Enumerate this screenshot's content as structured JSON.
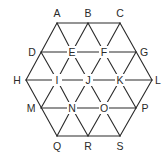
{
  "diagram": {
    "type": "hexagonal-triangular-grid",
    "colors": {
      "line": "#2a2a2a",
      "text": "#2a2a2a",
      "background": "#ffffff"
    },
    "nodes": [
      {
        "id": "A",
        "x": 57,
        "y": 23,
        "lx": 57,
        "ly": 13,
        "bg": false
      },
      {
        "id": "B",
        "x": 88,
        "y": 23,
        "lx": 88,
        "ly": 13,
        "bg": false
      },
      {
        "id": "C",
        "x": 120,
        "y": 23,
        "lx": 120,
        "ly": 13,
        "bg": false
      },
      {
        "id": "D",
        "x": 41,
        "y": 52,
        "lx": 32,
        "ly": 52,
        "bg": false
      },
      {
        "id": "E",
        "x": 72,
        "y": 52,
        "lx": 72,
        "ly": 52,
        "bg": true
      },
      {
        "id": "F",
        "x": 104,
        "y": 52,
        "lx": 104,
        "ly": 52,
        "bg": true
      },
      {
        "id": "G",
        "x": 136,
        "y": 52,
        "lx": 144,
        "ly": 52,
        "bg": false
      },
      {
        "id": "H",
        "x": 26,
        "y": 80,
        "lx": 17,
        "ly": 80,
        "bg": false
      },
      {
        "id": "I",
        "x": 57,
        "y": 80,
        "lx": 57,
        "ly": 80,
        "bg": true
      },
      {
        "id": "J",
        "x": 88,
        "y": 80,
        "lx": 88,
        "ly": 80,
        "bg": true
      },
      {
        "id": "K",
        "x": 120,
        "y": 80,
        "lx": 120,
        "ly": 80,
        "bg": true
      },
      {
        "id": "L",
        "x": 152,
        "y": 80,
        "lx": 158,
        "ly": 80,
        "bg": false
      },
      {
        "id": "M",
        "x": 41,
        "y": 108,
        "lx": 31,
        "ly": 108,
        "bg": false
      },
      {
        "id": "N",
        "x": 72,
        "y": 108,
        "lx": 72,
        "ly": 108,
        "bg": true
      },
      {
        "id": "O",
        "x": 104,
        "y": 108,
        "lx": 104,
        "ly": 108,
        "bg": true
      },
      {
        "id": "P",
        "x": 136,
        "y": 108,
        "lx": 145,
        "ly": 108,
        "bg": false
      },
      {
        "id": "Q",
        "x": 57,
        "y": 136,
        "lx": 57,
        "ly": 146,
        "bg": false
      },
      {
        "id": "R",
        "x": 88,
        "y": 136,
        "lx": 88,
        "ly": 146,
        "bg": false
      },
      {
        "id": "S",
        "x": 120,
        "y": 136,
        "lx": 120,
        "ly": 146,
        "bg": false
      }
    ],
    "edges": [
      [
        "A",
        "C"
      ],
      [
        "D",
        "G"
      ],
      [
        "H",
        "L"
      ],
      [
        "M",
        "P"
      ],
      [
        "Q",
        "S"
      ],
      [
        "A",
        "H"
      ],
      [
        "H",
        "Q"
      ],
      [
        "C",
        "L"
      ],
      [
        "L",
        "S"
      ],
      [
        "A",
        "E"
      ],
      [
        "E",
        "J"
      ],
      [
        "J",
        "O"
      ],
      [
        "O",
        "S"
      ],
      [
        "B",
        "F"
      ],
      [
        "F",
        "K"
      ],
      [
        "K",
        "P"
      ],
      [
        "D",
        "I"
      ],
      [
        "I",
        "N"
      ],
      [
        "N",
        "R"
      ],
      [
        "C",
        "F"
      ],
      [
        "F",
        "J"
      ],
      [
        "J",
        "N"
      ],
      [
        "N",
        "Q"
      ],
      [
        "B",
        "E"
      ],
      [
        "E",
        "I"
      ],
      [
        "I",
        "M"
      ],
      [
        "G",
        "K"
      ],
      [
        "K",
        "O"
      ],
      [
        "O",
        "R"
      ]
    ]
  }
}
